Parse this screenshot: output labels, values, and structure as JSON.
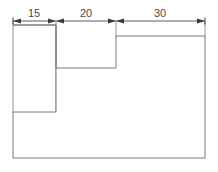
{
  "figure": {
    "type": "engineering-dimension-drawing",
    "units": "mm",
    "line_color": "#7a7a7a",
    "dimension_line_color": "#4a4a4a",
    "text_color": "#4a4a4a",
    "background_color": "#ffffff",
    "canvas": {
      "width": 218,
      "height": 172
    }
  },
  "dimensions": {
    "line_y": 21,
    "segments": [
      {
        "label": "15",
        "value": 15,
        "x_start": 13,
        "x_end": 56,
        "text_x": 34,
        "text_y": 17
      },
      {
        "label": "20",
        "value": 20,
        "x_start": 56,
        "x_end": 116,
        "text_x": 86,
        "text_y": 17
      },
      {
        "label": "30",
        "value": 30,
        "x_start": 116,
        "x_end": 205,
        "text_x": 160,
        "text_y": 17
      }
    ],
    "total": 65
  },
  "extension_lines": [
    {
      "x": 13,
      "y_top": 25,
      "y_bottom": 112
    },
    {
      "x": 56,
      "y_top": 25,
      "y_bottom": 112
    },
    {
      "x": 116,
      "y_top": 25,
      "y_bottom": 36
    },
    {
      "x": 205,
      "y_top": 25,
      "y_bottom": 36
    }
  ],
  "outline": {
    "points": "13,25 56,25 56,68 116,68 116,36 205,36 205,158 13,158 13,112 56,112 56,25",
    "vertices": [
      {
        "x": 13,
        "y": 25
      },
      {
        "x": 56,
        "y": 25
      },
      {
        "x": 56,
        "y": 68
      },
      {
        "x": 116,
        "y": 68
      },
      {
        "x": 116,
        "y": 36
      },
      {
        "x": 205,
        "y": 36
      },
      {
        "x": 205,
        "y": 158
      },
      {
        "x": 13,
        "y": 158
      },
      {
        "x": 13,
        "y": 112
      },
      {
        "x": 56,
        "y": 112
      }
    ]
  }
}
